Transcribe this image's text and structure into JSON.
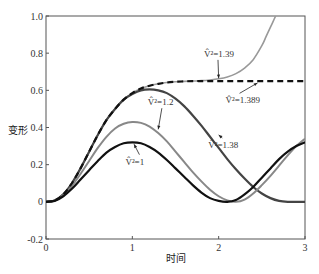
{
  "chart_data": {
    "type": "line",
    "title": "",
    "xlabel": "时间",
    "ylabel": "变形",
    "xlim": [
      0,
      3
    ],
    "ylim": [
      -0.2,
      1.0
    ],
    "xticks": [
      0,
      1,
      2,
      3
    ],
    "xtick_labels": [
      "0",
      "1",
      "2",
      "3"
    ],
    "yticks": [
      -0.2,
      0,
      0.2,
      0.4,
      0.6,
      0.8,
      1.0
    ],
    "ytick_labels": [
      "-0.2",
      "0",
      "0.2",
      "0.4",
      "0.6",
      "0.8",
      "1.0"
    ],
    "grid": false,
    "legend": "none (inline annotations)",
    "series": [
      {
        "name": "V̂²=1",
        "label": "V̂²=1",
        "color": "#111111",
        "style": "solid",
        "width": 2.2,
        "x": [
          0,
          0.1,
          0.2,
          0.3,
          0.4,
          0.5,
          0.6,
          0.7,
          0.8,
          0.9,
          1.0,
          1.1,
          1.2,
          1.3,
          1.4,
          1.5,
          1.6,
          1.7,
          1.8,
          1.9,
          2.0,
          2.1,
          2.2,
          2.3,
          2.4,
          2.5,
          2.6,
          2.7,
          2.8,
          2.9,
          3.0
        ],
        "y": [
          0,
          0.005,
          0.03,
          0.07,
          0.12,
          0.17,
          0.22,
          0.265,
          0.295,
          0.315,
          0.32,
          0.315,
          0.295,
          0.265,
          0.225,
          0.18,
          0.135,
          0.09,
          0.05,
          0.02,
          0.005,
          0.0,
          0.01,
          0.04,
          0.08,
          0.13,
          0.18,
          0.23,
          0.27,
          0.3,
          0.32
        ]
      },
      {
        "name": "V̂²=1.2",
        "label": "V̂²=1.2",
        "color": "#888888",
        "style": "solid",
        "width": 2.0,
        "x": [
          0,
          0.1,
          0.2,
          0.3,
          0.4,
          0.5,
          0.6,
          0.7,
          0.8,
          0.9,
          1.0,
          1.1,
          1.2,
          1.3,
          1.4,
          1.5,
          1.6,
          1.7,
          1.8,
          1.9,
          2.0,
          2.1,
          2.2,
          2.3,
          2.4,
          2.5,
          2.6,
          2.7,
          2.8,
          2.9,
          3.0
        ],
        "y": [
          0,
          0.006,
          0.035,
          0.085,
          0.15,
          0.22,
          0.29,
          0.35,
          0.395,
          0.42,
          0.43,
          0.425,
          0.405,
          0.37,
          0.325,
          0.27,
          0.215,
          0.16,
          0.11,
          0.065,
          0.03,
          0.008,
          0.0,
          0.012,
          0.045,
          0.09,
          0.14,
          0.195,
          0.25,
          0.3,
          0.34
        ]
      },
      {
        "name": "V̂²=1.38",
        "label": "V̂²=1.38",
        "color": "#444444",
        "style": "solid",
        "width": 2.2,
        "x": [
          0,
          0.1,
          0.2,
          0.3,
          0.4,
          0.5,
          0.6,
          0.7,
          0.8,
          0.9,
          1.0,
          1.1,
          1.2,
          1.3,
          1.4,
          1.5,
          1.6,
          1.7,
          1.8,
          1.9,
          2.0,
          2.1,
          2.2,
          2.3,
          2.4,
          2.5,
          2.6,
          2.7,
          2.8,
          2.9,
          3.0
        ],
        "y": [
          0,
          0.007,
          0.04,
          0.1,
          0.18,
          0.27,
          0.36,
          0.44,
          0.5,
          0.55,
          0.58,
          0.6,
          0.605,
          0.6,
          0.585,
          0.555,
          0.515,
          0.465,
          0.41,
          0.35,
          0.29,
          0.23,
          0.175,
          0.125,
          0.08,
          0.045,
          0.02,
          0.005,
          0.0,
          0.0,
          0.0
        ]
      },
      {
        "name": "V̂²=1.389",
        "label": "V̂²=1.389",
        "color": "#111111",
        "style": "dashed",
        "width": 2.2,
        "x": [
          0,
          0.1,
          0.2,
          0.3,
          0.4,
          0.5,
          0.6,
          0.7,
          0.8,
          0.9,
          1.0,
          1.1,
          1.2,
          1.3,
          1.4,
          1.5,
          1.6,
          1.7,
          1.8,
          1.9,
          2.0,
          2.1,
          2.2,
          2.3,
          2.4,
          2.5,
          2.6,
          2.7,
          2.8,
          2.9,
          3.0
        ],
        "y": [
          0,
          0.007,
          0.04,
          0.1,
          0.18,
          0.27,
          0.36,
          0.44,
          0.5,
          0.55,
          0.585,
          0.61,
          0.625,
          0.635,
          0.642,
          0.646,
          0.648,
          0.65,
          0.65,
          0.65,
          0.65,
          0.65,
          0.65,
          0.65,
          0.65,
          0.65,
          0.65,
          0.65,
          0.65,
          0.65,
          0.65
        ]
      },
      {
        "name": "V̂²=1.39",
        "label": "V̂²=1.39",
        "color": "#999999",
        "style": "solid",
        "width": 1.6,
        "x": [
          0,
          0.1,
          0.2,
          0.3,
          0.4,
          0.5,
          0.6,
          0.7,
          0.8,
          0.9,
          1.0,
          1.1,
          1.2,
          1.3,
          1.4,
          1.5,
          1.6,
          1.7,
          1.8,
          1.9,
          2.0,
          2.1,
          2.2,
          2.3,
          2.4,
          2.5,
          2.55,
          2.6,
          2.63,
          2.66
        ],
        "y": [
          0,
          0.007,
          0.04,
          0.1,
          0.18,
          0.27,
          0.36,
          0.44,
          0.5,
          0.55,
          0.585,
          0.61,
          0.625,
          0.635,
          0.642,
          0.646,
          0.648,
          0.65,
          0.652,
          0.656,
          0.662,
          0.672,
          0.69,
          0.72,
          0.765,
          0.84,
          0.89,
          0.94,
          0.97,
          1.0
        ]
      }
    ],
    "annotations": [
      {
        "text": "V̂²=1.39",
        "text_x": 1.83,
        "text_y": 0.78,
        "arrow_to_x": 2.0,
        "arrow_to_y": 0.665
      },
      {
        "text": "V̂²=1.389",
        "text_x": 2.08,
        "text_y": 0.53,
        "arrow_to_x": 2.45,
        "arrow_to_y": 0.64
      },
      {
        "text": "V̂²=1.2",
        "text_x": 1.18,
        "text_y": 0.52,
        "arrow_to_x": 1.3,
        "arrow_to_y": 0.39
      },
      {
        "text": "V̂²=1.38",
        "text_x": 1.88,
        "text_y": 0.29,
        "arrow_to_x": 2.0,
        "arrow_to_y": 0.36
      },
      {
        "text": "V̂²=1",
        "text_x": 0.92,
        "text_y": 0.2,
        "arrow_to_x": 1.02,
        "arrow_to_y": 0.31
      }
    ]
  }
}
